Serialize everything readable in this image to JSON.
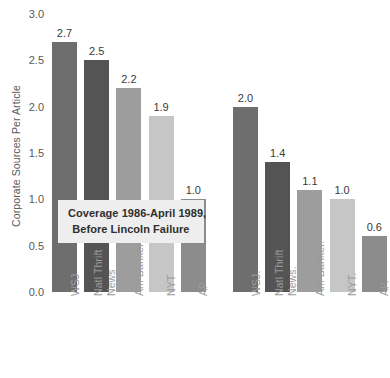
{
  "chart_data": {
    "type": "bar",
    "title": "",
    "xlabel": "",
    "ylabel": "Corporate Sources Per Article",
    "ylim": [
      0.0,
      3.0
    ],
    "ytick_labels": [
      "0.0",
      "0.5",
      "1.0",
      "1.5",
      "2.0",
      "2.5",
      "3.0"
    ],
    "ytick_values": [
      0.0,
      0.5,
      1.0,
      1.5,
      2.0,
      2.5,
      3.0
    ],
    "grid": false,
    "legend": "none",
    "categories": [
      "WSJ",
      "Natl Thrift News",
      "Am Banker",
      "NYT",
      "AP",
      "WSJ.",
      "Natl Thrift News.",
      "Am Banker.",
      "NYT.",
      "AP."
    ],
    "values": [
      2.7,
      2.5,
      2.2,
      1.9,
      1.0,
      2.0,
      1.4,
      1.1,
      1.0,
      0.6
    ],
    "value_labels": [
      "2.7",
      "2.5",
      "2.2",
      "1.9",
      "1.0",
      "2.0",
      "1.4",
      "1.1",
      "1.0",
      "0.6"
    ],
    "bar_colors": [
      "#6e6e6e",
      "#545454",
      "#9d9d9d",
      "#c6c6c6",
      "#8c8c8c",
      "#6e6e6e",
      "#545454",
      "#9d9d9d",
      "#c6c6c6",
      "#8c8c8c"
    ],
    "annotations": [
      {
        "line1": "Coverage 1986-April 1989,",
        "line2": "Before Lincoln Failure"
      }
    ]
  },
  "axis": {
    "ylabel_text": "Corporate Sources Per Article"
  },
  "bars": [
    {
      "label_line1": "WSJ",
      "label_line2": "",
      "value_label": "2.7"
    },
    {
      "label_line1": "Natl Thrift",
      "label_line2": "News",
      "value_label": "2.5"
    },
    {
      "label_line1": "Am Banker",
      "label_line2": "",
      "value_label": "2.2"
    },
    {
      "label_line1": "NYT",
      "label_line2": "",
      "value_label": "1.9"
    },
    {
      "label_line1": "AP",
      "label_line2": "",
      "value_label": "1.0"
    },
    {
      "label_line1": "WSJ.",
      "label_line2": "",
      "value_label": "2.0"
    },
    {
      "label_line1": "Natl Thrift",
      "label_line2": "News.",
      "value_label": "1.4"
    },
    {
      "label_line1": "Am Banker.",
      "label_line2": "",
      "value_label": "1.1"
    },
    {
      "label_line1": "NYT.",
      "label_line2": "",
      "value_label": "1.0"
    },
    {
      "label_line1": "AP.",
      "label_line2": "",
      "value_label": "0.6"
    }
  ],
  "annotation": {
    "line1": "Coverage 1986-April 1989,",
    "line2": "Before Lincoln Failure",
    "background": "#eeeeee"
  },
  "yticks": [
    "3.0",
    "2.5",
    "2.0",
    "1.5",
    "1.0",
    "0.5",
    "0.0"
  ]
}
